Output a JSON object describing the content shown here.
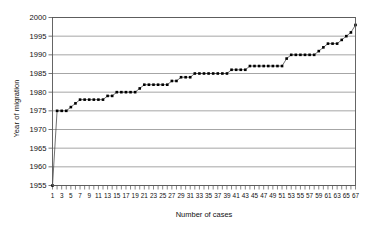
{
  "chart_data": {
    "type": "scatter",
    "title": "",
    "xlabel": "Number of cases",
    "ylabel": "Year of migration",
    "xlim": [
      1,
      67
    ],
    "ylim": [
      1955,
      2000
    ],
    "grid": true,
    "legend": false,
    "marker": "filled-square",
    "line": "thin-connecting-line",
    "ytick_labels": [
      "1955",
      "1960",
      "1965",
      "1970",
      "1975",
      "1980",
      "1985",
      "1990",
      "1995",
      "2000"
    ],
    "ytick_values": [
      1955,
      1960,
      1965,
      1970,
      1975,
      1980,
      1985,
      1990,
      1995,
      2000
    ],
    "xtick_labels": [
      "1",
      "3",
      "5",
      "7",
      "9",
      "11",
      "13",
      "15",
      "17",
      "19",
      "21",
      "23",
      "25",
      "27",
      "29",
      "31",
      "33",
      "35",
      "37",
      "39",
      "41",
      "43",
      "45",
      "47",
      "49",
      "51",
      "53",
      "55",
      "57",
      "59",
      "61",
      "63",
      "65",
      "67"
    ],
    "xtick_values": [
      1,
      3,
      5,
      7,
      9,
      11,
      13,
      15,
      17,
      19,
      21,
      23,
      25,
      27,
      29,
      31,
      33,
      35,
      37,
      39,
      41,
      43,
      45,
      47,
      49,
      51,
      53,
      55,
      57,
      59,
      61,
      63,
      65,
      67
    ],
    "x": [
      1,
      2,
      3,
      4,
      5,
      6,
      7,
      8,
      9,
      10,
      11,
      12,
      13,
      14,
      15,
      16,
      17,
      18,
      19,
      20,
      21,
      22,
      23,
      24,
      25,
      26,
      27,
      28,
      29,
      30,
      31,
      32,
      33,
      34,
      35,
      36,
      37,
      38,
      39,
      40,
      41,
      42,
      43,
      44,
      45,
      46,
      47,
      48,
      49,
      50,
      51,
      52,
      53,
      54,
      55,
      56,
      57,
      58,
      59,
      60,
      61,
      62,
      63,
      64,
      65,
      66,
      67
    ],
    "values": [
      1955,
      1975,
      1975,
      1975,
      1976,
      1977,
      1978,
      1978,
      1978,
      1978,
      1978,
      1978,
      1979,
      1979,
      1980,
      1980,
      1980,
      1980,
      1980,
      1981,
      1982,
      1982,
      1982,
      1982,
      1982,
      1982,
      1983,
      1983,
      1984,
      1984,
      1984,
      1985,
      1985,
      1985,
      1985,
      1985,
      1985,
      1985,
      1985,
      1986,
      1986,
      1986,
      1986,
      1987,
      1987,
      1987,
      1987,
      1987,
      1987,
      1987,
      1987,
      1989,
      1990,
      1990,
      1990,
      1990,
      1990,
      1990,
      1991,
      1992,
      1993,
      1993,
      1993,
      1994,
      1995,
      1996,
      1998
    ],
    "categories": [
      "1",
      "2",
      "3",
      "4",
      "5",
      "6",
      "7",
      "8",
      "9",
      "10",
      "11",
      "12",
      "13",
      "14",
      "15",
      "16",
      "17",
      "18",
      "19",
      "20",
      "21",
      "22",
      "23",
      "24",
      "25",
      "26",
      "27",
      "28",
      "29",
      "30",
      "31",
      "32",
      "33",
      "34",
      "35",
      "36",
      "37",
      "38",
      "39",
      "40",
      "41",
      "42",
      "43",
      "44",
      "45",
      "46",
      "47",
      "48",
      "49",
      "50",
      "51",
      "52",
      "53",
      "54",
      "55",
      "56",
      "57",
      "58",
      "59",
      "60",
      "61",
      "62",
      "63",
      "64",
      "65",
      "66",
      "67"
    ],
    "colors": {
      "marker": "#000000",
      "line": "#333333",
      "grid": "#808080",
      "axis": "#555555",
      "background": "#ffffff"
    }
  }
}
